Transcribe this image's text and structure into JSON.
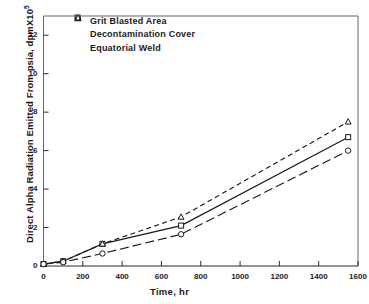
{
  "chart_data": {
    "type": "line",
    "title": "",
    "xlabel": "Time, hr",
    "ylabel": "Direct Alpha Radiation Emitted From psia, dpmX10",
    "ylabel_exponent": "5",
    "xlim": [
      0,
      1600
    ],
    "ylim": [
      0,
      13
    ],
    "xticks": [
      0,
      200,
      400,
      600,
      800,
      1000,
      1200,
      1400,
      1600
    ],
    "yticks": [
      2,
      4,
      6,
      8,
      10,
      12
    ],
    "grid": false,
    "legend_position": "top-left",
    "series": [
      {
        "name": "Grit Blasted Area",
        "marker": "square",
        "linestyle": "solid",
        "x": [
          0,
          100,
          300,
          700,
          1550
        ],
        "y": [
          0.1,
          0.25,
          1.15,
          2.1,
          6.7
        ]
      },
      {
        "name": "Decontamination Cover",
        "marker": "triangle",
        "linestyle": "dashed",
        "x": [
          0,
          100,
          300,
          700,
          1550
        ],
        "y": [
          0.1,
          0.25,
          1.15,
          2.55,
          7.5
        ]
      },
      {
        "name": "Equatorial Weld",
        "marker": "circle",
        "linestyle": "dashdot",
        "x": [
          0,
          100,
          300,
          700,
          1550
        ],
        "y": [
          0.1,
          0.2,
          0.65,
          1.65,
          6.0
        ]
      }
    ]
  },
  "axis": {
    "x_tick_labels": [
      "0",
      "200",
      "400",
      "600",
      "800",
      "1000",
      "1200",
      "1400",
      "1600"
    ],
    "y_tick_labels": [
      "2",
      "4",
      "6",
      "8",
      "10",
      "12"
    ]
  },
  "colors": {
    "ink": "#1a1a1a",
    "frame": "#555555"
  }
}
